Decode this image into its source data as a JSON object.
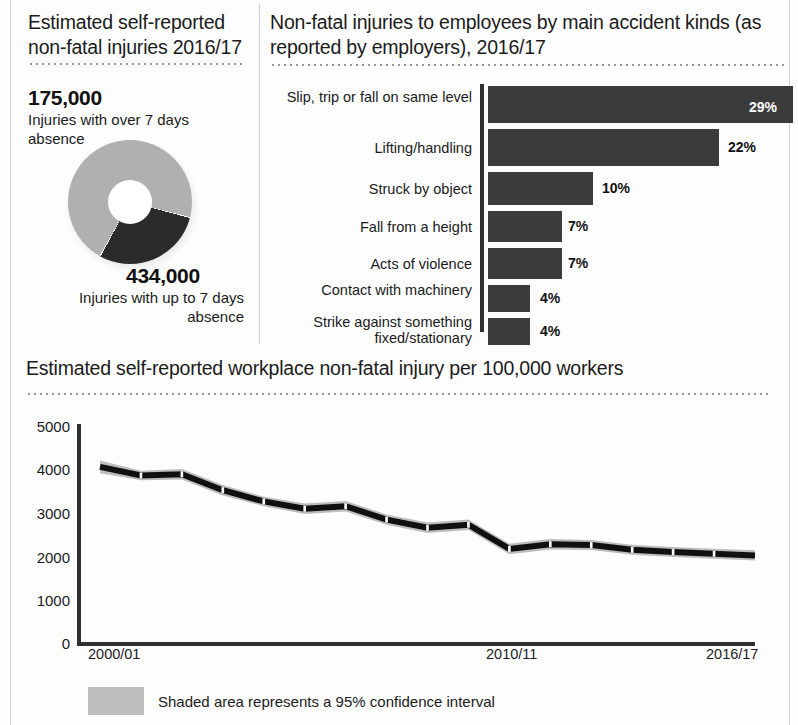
{
  "left_panel": {
    "title": "Estimated self-reported non-fatal injuries 2016/17",
    "over7_value": "175,000",
    "over7_label": "Injuries with over 7 days absence",
    "upto7_value": "434,000",
    "upto7_label": "Injuries with up to 7 days absence",
    "donut": {
      "type": "pie",
      "title": "Estimated self-reported non-fatal injuries 2016/17",
      "labels": [
        "Injuries with over 7 days absence",
        "Injuries with up to 7 days absence"
      ],
      "values": [
        175000,
        434000
      ],
      "percentages": [
        28.7,
        71.3
      ],
      "colors": [
        "#2b2b2b",
        "#b0b0b0"
      ]
    }
  },
  "right_panel": {
    "title": "Non-fatal injuries to employees by main accident kinds (as reported by employers), 2016/17",
    "chart": {
      "type": "bar",
      "orientation": "horizontal",
      "title": "Non-fatal injuries to employees by main accident kinds (as reported by employers), 2016/17",
      "categories": [
        "Slip, trip or fall on same level",
        "Lifting/handling",
        "Struck by object",
        "Fall from a height",
        "Acts of violence",
        "Contact with machinery",
        "Strike against something fixed/stationary"
      ],
      "values": [
        29,
        22,
        10,
        7,
        7,
        4,
        4
      ],
      "value_labels": [
        "29%",
        "22%",
        "10%",
        "7%",
        "7%",
        "4%",
        "4%"
      ],
      "xlabel": "",
      "ylabel": "",
      "xlim": [
        0,
        30
      ],
      "grid": false,
      "bar_color": "#3b3b3b"
    }
  },
  "bottom_panel": {
    "title": "Estimated self-reported workplace non-fatal injury per 100,000 workers",
    "legend_text": "Shaded area represents a 95% confidence interval",
    "chart": {
      "type": "line",
      "title": "Estimated self-reported workplace non-fatal injury per 100,000 workers",
      "xlabel": "",
      "ylabel": "",
      "ylim": [
        0,
        5000
      ],
      "yticks": [
        0,
        1000,
        2000,
        3000,
        4000,
        5000
      ],
      "ytick_labels": [
        "0",
        "1000",
        "2000",
        "3000",
        "4000",
        "5000"
      ],
      "xticks": [
        "2000/01",
        "2010/11",
        "2016/17"
      ],
      "grid": false,
      "x": [
        "2000/01",
        "2001/02",
        "2002/03",
        "2003/04",
        "2004/05",
        "2005/06",
        "2006/07",
        "2007/08",
        "2008/09",
        "2009/10",
        "2010/11",
        "2011/12",
        "2012/13",
        "2013/14",
        "2014/15",
        "2015/16",
        "2016/17"
      ],
      "series": [
        {
          "name": "Estimated self-reported workplace non-fatal injury per 100,000 workers",
          "values": [
            4100,
            3900,
            3930,
            3560,
            3300,
            3130,
            3190,
            2880,
            2690,
            2760,
            2200,
            2310,
            2290,
            2180,
            2130,
            2090,
            2050
          ],
          "color": "#101010"
        }
      ],
      "confidence_band": {
        "label": "95% confidence interval",
        "color": "#bdbdbd",
        "upper": [
          4250,
          4010,
          4050,
          3680,
          3410,
          3250,
          3310,
          3000,
          2810,
          2880,
          2320,
          2430,
          2405,
          2295,
          2245,
          2205,
          2170
        ],
        "lower": [
          3950,
          3790,
          3810,
          3440,
          3190,
          3010,
          3070,
          2760,
          2570,
          2640,
          2080,
          2190,
          2175,
          2065,
          2015,
          1975,
          1930
        ]
      }
    }
  }
}
